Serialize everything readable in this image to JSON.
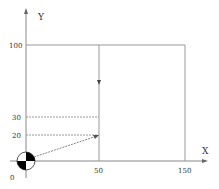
{
  "diagram": {
    "axes": {
      "x_label": "X",
      "y_label": "Y",
      "origin_label": "0"
    },
    "x_ticks": [
      {
        "value": 50,
        "label": "50"
      },
      {
        "value": 150,
        "label": "150"
      }
    ],
    "y_ticks": [
      {
        "value": 20,
        "label": "20"
      },
      {
        "value": 30,
        "label": "30"
      },
      {
        "value": 100,
        "label": "100"
      }
    ],
    "region": {
      "x_min": 50,
      "x_max": 150,
      "y_min": 0,
      "y_max": 100
    },
    "dashed_lines": [
      {
        "from": [
          0,
          20
        ],
        "to": [
          50,
          20
        ]
      },
      {
        "from": [
          0,
          30
        ],
        "to": [
          50,
          30
        ]
      }
    ],
    "arrow": {
      "from": [
        0,
        0
      ],
      "to": [
        50,
        20
      ]
    },
    "direction_marker": {
      "at_x": 50,
      "direction": "down"
    },
    "origin_symbol": "center-of-gravity-icon",
    "colors": {
      "line": "#999999",
      "text": "#333333",
      "symbol_fill": "#000000"
    }
  }
}
